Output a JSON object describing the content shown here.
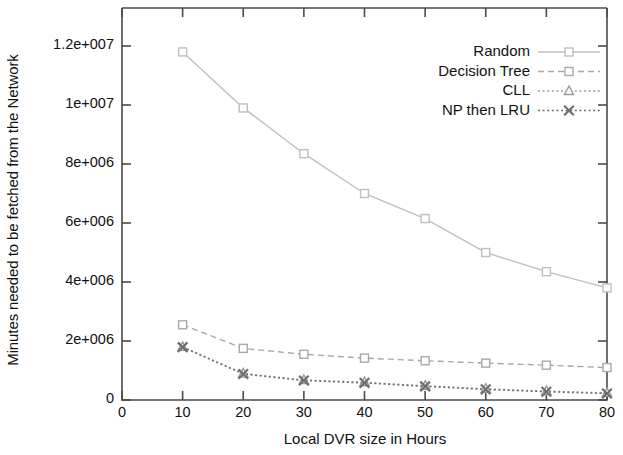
{
  "chart_data": {
    "type": "line",
    "title": "",
    "xlabel": "Local DVR size in Hours",
    "ylabel": "Minutes needed to be fetched from the Network",
    "xlim": [
      0,
      80
    ],
    "ylim": [
      0,
      13000000
    ],
    "grid": false,
    "legend_position": "top-right",
    "x": [
      10,
      20,
      30,
      40,
      50,
      60,
      70,
      80
    ],
    "xticks": [
      "0",
      "10",
      "20",
      "30",
      "40",
      "50",
      "60",
      "70",
      "80"
    ],
    "xtick_values": [
      0,
      10,
      20,
      30,
      40,
      50,
      60,
      70,
      80
    ],
    "yticks": [
      "0",
      "2e+006",
      "4e+006",
      "6e+006",
      "8e+006",
      "1e+007",
      "1.2e+007"
    ],
    "ytick_values": [
      0,
      2000000,
      4000000,
      6000000,
      8000000,
      10000000,
      12000000
    ],
    "series": [
      {
        "name": "Random",
        "color": "#bfbfbf",
        "marker": "square-open",
        "dash": "solid",
        "values": [
          11800000,
          9900000,
          8350000,
          7000000,
          6150000,
          5000000,
          4350000,
          3800000
        ]
      },
      {
        "name": "Decision Tree",
        "color": "#a8a8a8",
        "marker": "square-open",
        "dash": "dashed",
        "values": [
          2550000,
          1750000,
          1550000,
          1420000,
          1330000,
          1250000,
          1180000,
          1100000
        ]
      },
      {
        "name": "CLL",
        "color": "#9a9a9a",
        "marker": "triangle-open",
        "dash": "dotted",
        "values": [
          1800000,
          900000,
          680000,
          600000,
          480000,
          380000,
          300000,
          240000
        ]
      },
      {
        "name": "NP then LRU",
        "color": "#6e6e6e",
        "marker": "cross",
        "dash": "dotted",
        "values": [
          1790000,
          880000,
          660000,
          580000,
          460000,
          360000,
          280000,
          220000
        ]
      }
    ]
  },
  "axes": {
    "x_title": "Local DVR size in Hours",
    "y_title": "Minutes needed to be fetched from the Network"
  }
}
